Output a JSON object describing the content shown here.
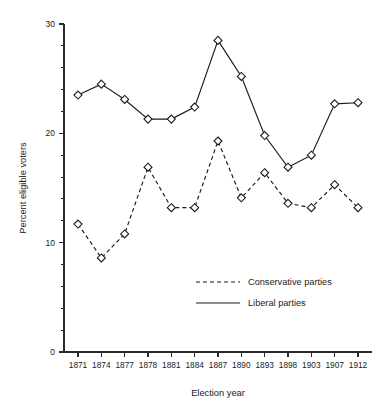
{
  "chart_data": {
    "type": "line",
    "title": "",
    "xlabel": "Election year",
    "ylabel": "Percent eligible voters",
    "categories": [
      "1871",
      "1874",
      "1877",
      "1878",
      "1881",
      "1884",
      "1887",
      "1890",
      "1893",
      "1898",
      "1903",
      "1907",
      "1912"
    ],
    "yticks": [
      0,
      10,
      20,
      30
    ],
    "ylim": [
      0,
      30
    ],
    "minor_tick_step": 2,
    "grid": false,
    "legend_position": "center-right",
    "marker": "open-diamond",
    "series": [
      {
        "name": "Conservative parties",
        "linestyle": "dashed",
        "color": "#1a1a1a",
        "values": [
          11.7,
          8.6,
          10.8,
          16.9,
          13.2,
          13.2,
          19.3,
          14.1,
          16.4,
          13.6,
          13.2,
          15.3,
          13.2
        ]
      },
      {
        "name": "Liberal parties",
        "linestyle": "solid",
        "color": "#1a1a1a",
        "values": [
          23.5,
          24.5,
          23.1,
          21.3,
          21.3,
          22.4,
          28.5,
          25.2,
          19.8,
          16.9,
          18.0,
          22.7,
          22.8
        ]
      }
    ]
  },
  "legend": {
    "entries": [
      {
        "label": "Conservative parties"
      },
      {
        "label": "Liberal parties"
      }
    ]
  },
  "axes": {
    "x_title": "Election year",
    "y_title": "Percent eligible voters"
  }
}
